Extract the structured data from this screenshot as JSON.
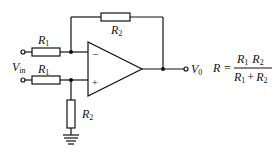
{
  "diagram": {
    "type": "op-amp differential amplifier circuit",
    "components": {
      "r1_top": {
        "name": "R",
        "sub": "1"
      },
      "r1_bottom": {
        "name": "R",
        "sub": "1"
      },
      "r2_feedback": {
        "name": "R",
        "sub": "2"
      },
      "r2_ground": {
        "name": "R",
        "sub": "2"
      },
      "opamp": {
        "inverting": "−",
        "noninverting": "+"
      }
    },
    "labels": {
      "input": {
        "name": "V",
        "sub": "in"
      },
      "output": {
        "name": "V",
        "sub": "0"
      }
    },
    "equation": {
      "lhs": "R =",
      "numerator_a": "R",
      "numerator_a_sub": "1",
      "numerator_b": "R",
      "numerator_b_sub": "2",
      "denominator_a": "R",
      "denominator_a_sub": "1",
      "denominator_op": "+",
      "denominator_b": "R",
      "denominator_b_sub": "2"
    }
  }
}
